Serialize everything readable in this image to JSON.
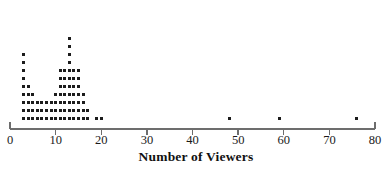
{
  "figure": {
    "background_color": "#ffffff",
    "dot_color": "#1c1c1c",
    "axis_color": "#6d6d6d"
  },
  "axis": {
    "title": "Number of Viewers",
    "tick_labels": [
      "0",
      "10",
      "20",
      "30",
      "40",
      "50",
      "60",
      "70",
      "80"
    ]
  },
  "chart_data": {
    "type": "scatter",
    "plot_kind": "dotplot",
    "title": "",
    "xlabel": "Number of Viewers",
    "ylabel": "",
    "xlim": [
      0,
      80
    ],
    "ylim": [
      0,
      12
    ],
    "xticks": [
      0,
      10,
      20,
      30,
      40,
      50,
      60,
      70,
      80
    ],
    "grid": false,
    "legend": false,
    "dot_size_px": 3,
    "stack_spacing_units": 1,
    "note": "Each dot represents one observation; dots are stacked vertically at each integer value.",
    "values": [
      3,
      4,
      5,
      6,
      7,
      8,
      9,
      10,
      11,
      12,
      13,
      14,
      15,
      16,
      17,
      19,
      20,
      48,
      59,
      76
    ],
    "counts": [
      9,
      5,
      4,
      3,
      3,
      3,
      3,
      4,
      7,
      7,
      11,
      7,
      7,
      4,
      2,
      1,
      1,
      1,
      1,
      1
    ],
    "stacks": [
      {
        "value": 3,
        "count": 9
      },
      {
        "value": 4,
        "count": 5
      },
      {
        "value": 5,
        "count": 4
      },
      {
        "value": 6,
        "count": 3
      },
      {
        "value": 7,
        "count": 3
      },
      {
        "value": 8,
        "count": 3
      },
      {
        "value": 9,
        "count": 3
      },
      {
        "value": 10,
        "count": 4
      },
      {
        "value": 11,
        "count": 7
      },
      {
        "value": 12,
        "count": 7
      },
      {
        "value": 13,
        "count": 11
      },
      {
        "value": 14,
        "count": 7
      },
      {
        "value": 15,
        "count": 7
      },
      {
        "value": 16,
        "count": 4
      },
      {
        "value": 17,
        "count": 2
      },
      {
        "value": 19,
        "count": 1
      },
      {
        "value": 20,
        "count": 1
      },
      {
        "value": 48,
        "count": 1
      },
      {
        "value": 59,
        "count": 1
      },
      {
        "value": 76,
        "count": 1
      }
    ],
    "total_observations": 86,
    "outliers": [
      48,
      59,
      76
    ]
  }
}
